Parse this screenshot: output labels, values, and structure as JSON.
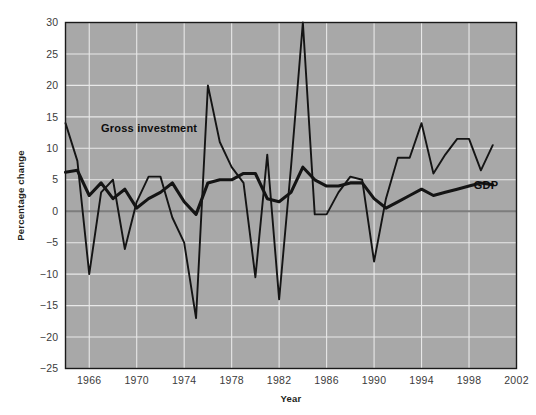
{
  "chart_data": {
    "type": "line",
    "title": "",
    "xlabel": "Year",
    "ylabel": "Percentage change",
    "xlim": [
      1964,
      2002
    ],
    "ylim": [
      -25,
      30
    ],
    "ytick_values": [
      30,
      25,
      20,
      15,
      10,
      5,
      0,
      -5,
      -10,
      -15,
      -20,
      -25
    ],
    "ytick_labels": [
      "30",
      "25",
      "20",
      "15",
      "10",
      "5",
      "0",
      "-5",
      "-10",
      "-15",
      "-20",
      "-25"
    ],
    "xtick_values": [
      1966,
      1970,
      1974,
      1978,
      1982,
      1986,
      1990,
      1994,
      1998,
      2002
    ],
    "xtick_labels": [
      "1966",
      "1970",
      "1974",
      "1978",
      "1982",
      "1986",
      "1990",
      "1994",
      "1998",
      "2002"
    ],
    "grid": true,
    "legend_position": "inline-annotations",
    "zero_reference_line": 0,
    "x": [
      1964,
      1965,
      1966,
      1967,
      1968,
      1969,
      1970,
      1971,
      1972,
      1973,
      1974,
      1975,
      1976,
      1977,
      1978,
      1979,
      1980,
      1981,
      1982,
      1983,
      1984,
      1985,
      1986,
      1987,
      1988,
      1989,
      1990,
      1991,
      1992,
      1993,
      1994,
      1995,
      1996,
      1997,
      1998,
      1999,
      2000
    ],
    "series": [
      {
        "name": "Gross investment",
        "label": "Gross investment",
        "color": "#141414",
        "stroke_width": 1.9,
        "label_x": 1967.0,
        "label_y": 13.2,
        "values": [
          14.0,
          8.0,
          -10.0,
          3.0,
          5.0,
          -6.0,
          1.5,
          5.5,
          5.5,
          -1.0,
          -5.0,
          -17.0,
          20.0,
          11.0,
          7.0,
          4.5,
          -10.5,
          9.0,
          -14.0,
          7.0,
          30.0,
          -0.5,
          -0.5,
          3.0,
          5.5,
          5.0,
          -8.0,
          2.0,
          8.5,
          8.5,
          14.0,
          6.0,
          9.0,
          11.5,
          11.5,
          6.5,
          10.5
        ]
      },
      {
        "name": "GDP",
        "label": "GDP",
        "color": "#141414",
        "stroke_width": 3.1,
        "label_x": 1998.4,
        "label_y": 4.2,
        "values": [
          6.2,
          6.5,
          2.5,
          4.5,
          2.0,
          3.5,
          0.5,
          2.0,
          3.0,
          4.5,
          1.5,
          -0.5,
          4.5,
          5.0,
          5.0,
          6.0,
          6.0,
          2.0,
          1.5,
          3.0,
          7.0,
          5.0,
          4.0,
          4.0,
          4.5,
          4.5,
          2.0,
          0.5,
          1.5,
          2.5,
          3.5,
          2.5,
          3.0,
          3.5,
          4.0,
          4.5,
          4.2
        ]
      }
    ]
  },
  "axes": {
    "x_title": "Year",
    "y_title": "Percentage change"
  },
  "colors": {
    "plot_background": "#a8a8a8",
    "grid": "#e8e8e8",
    "zero_line": "#7d7d7d",
    "line": "#141414",
    "page_background": "#ffffff",
    "tick_text": "#3b3b3b"
  }
}
